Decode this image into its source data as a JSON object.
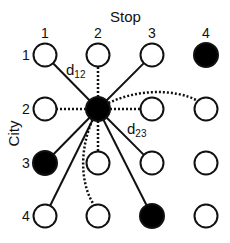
{
  "diagram": {
    "x_axis_title": "Stop",
    "y_axis_title": "City",
    "column_labels": [
      "1",
      "2",
      "3",
      "4"
    ],
    "row_labels": [
      "1",
      "2",
      "3",
      "4"
    ],
    "colors": {
      "stroke": "#111111",
      "filled": "#000000",
      "empty": "#ffffff"
    },
    "hub": {
      "city": 2,
      "stop": 2
    },
    "filled_nodes": [
      {
        "city": 1,
        "stop": 4
      },
      {
        "city": 2,
        "stop": 2
      },
      {
        "city": 3,
        "stop": 1
      },
      {
        "city": 4,
        "stop": 3
      }
    ],
    "solid_edges_from_hub": [
      {
        "city": 1,
        "stop": 1
      },
      {
        "city": 1,
        "stop": 3
      },
      {
        "city": 3,
        "stop": 1
      },
      {
        "city": 3,
        "stop": 3
      },
      {
        "city": 4,
        "stop": 1
      },
      {
        "city": 4,
        "stop": 3
      }
    ],
    "dotted_edges_from_hub": [
      {
        "city": 1,
        "stop": 2
      },
      {
        "city": 2,
        "stop": 1
      },
      {
        "city": 2,
        "stop": 3
      },
      {
        "city": 3,
        "stop": 2
      },
      {
        "city": 2,
        "stop": 4,
        "curved": true
      },
      {
        "city": 4,
        "stop": 2,
        "curved": true
      }
    ],
    "edge_labels": [
      {
        "base": "d",
        "sub": "12"
      },
      {
        "base": "d",
        "sub": "23"
      }
    ]
  }
}
